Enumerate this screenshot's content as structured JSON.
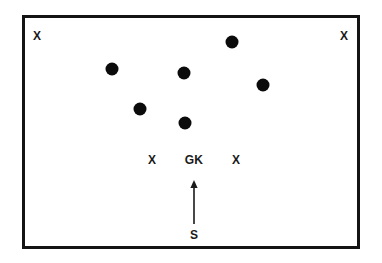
{
  "diagram": {
    "type": "sports-play-diagram",
    "colors": {
      "background": "#ffffff",
      "border": "#141414",
      "player_dot": "#0b0b0b",
      "text": "#1a1a1a",
      "arrow": "#1a1a1a"
    },
    "pitch": {
      "x": 22,
      "y": 15,
      "width": 338,
      "height": 234,
      "border_width": 3
    },
    "corner_markers": [
      {
        "label": "X",
        "x": 37,
        "y": 36,
        "name": "corner-marker-top-left"
      },
      {
        "label": "X",
        "x": 344,
        "y": 36,
        "name": "corner-marker-top-right"
      }
    ],
    "wall_markers": [
      {
        "label": "X",
        "x": 152,
        "y": 160,
        "name": "wall-marker-left"
      },
      {
        "label": "GK",
        "x": 194,
        "y": 160,
        "name": "goalkeeper-marker"
      },
      {
        "label": "X",
        "x": 236,
        "y": 160,
        "name": "wall-marker-right"
      }
    ],
    "players": [
      {
        "x": 112,
        "y": 69,
        "r": 6.5,
        "name": "player-dot-1"
      },
      {
        "x": 184,
        "y": 73,
        "r": 6.5,
        "name": "player-dot-2"
      },
      {
        "x": 232,
        "y": 42,
        "r": 6.5,
        "name": "player-dot-3"
      },
      {
        "x": 263,
        "y": 85,
        "r": 6.5,
        "name": "player-dot-4"
      },
      {
        "x": 140,
        "y": 109,
        "r": 6.5,
        "name": "player-dot-5"
      },
      {
        "x": 185,
        "y": 123,
        "r": 6.5,
        "name": "player-dot-6"
      }
    ],
    "shot_arrow": {
      "label": "S",
      "label_x": 194,
      "label_y": 235,
      "tail_x": 194,
      "tail_y": 224,
      "head_x": 194,
      "head_y": 182,
      "stroke_width": 1.6,
      "head_size": 5
    }
  }
}
